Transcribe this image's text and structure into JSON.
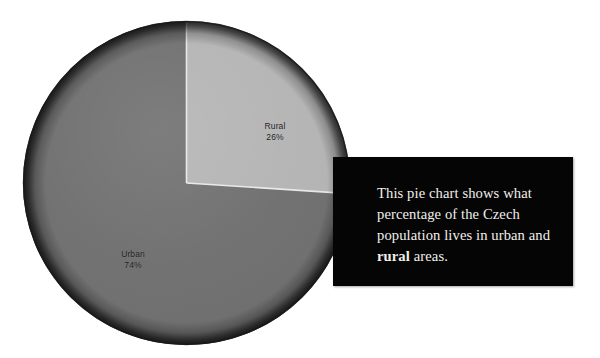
{
  "figure": {
    "background_color": "#ffffff",
    "width": 600,
    "height": 358
  },
  "chart_data": {
    "type": "pie",
    "title": "",
    "subtitle": "",
    "xlabel": "",
    "ylabel": "",
    "legend_position": "none",
    "grid": false,
    "start_angle_deg": 0,
    "direction": "clockwise",
    "categories": [
      "Rural",
      "Urban"
    ],
    "values": [
      26,
      74
    ],
    "unit": "%",
    "labels": [
      "Rural\n26%",
      "Urban\n74%"
    ],
    "slices": [
      {
        "name": "Rural",
        "value": 26,
        "value_label": "26%",
        "color": "#b4b4b4",
        "rim_color": "#6e6e6e",
        "start_deg": 0,
        "end_deg": 93.6,
        "label_position": "inside"
      },
      {
        "name": "Urban",
        "value": 74,
        "value_label": "74%",
        "color": "#6f6f6f",
        "rim_color": "#242424",
        "start_deg": 93.6,
        "end_deg": 360,
        "label_position": "inside"
      }
    ],
    "separator_color": "#e8e8e8",
    "annotations": [
      "This pie chart shows what percentage of the Czech population lives in urban and rural areas."
    ]
  },
  "labels": {
    "rural": {
      "name": "Rural",
      "value": "26%"
    },
    "urban": {
      "name": "Urban",
      "value": "74%"
    }
  },
  "caption": {
    "background_color": "#050505",
    "text_color": "#f2f0ec",
    "segments": [
      {
        "text": "This pie chart shows what percentage of the Czech population lives in urban and ",
        "bold": false
      },
      {
        "text": "rural",
        "bold": true
      },
      {
        "text": " areas.",
        "bold": false
      }
    ],
    "full_text": "This pie chart shows what percentage of the Czech population lives in urban and rural areas."
  }
}
